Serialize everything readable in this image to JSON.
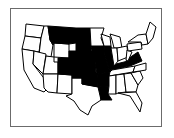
{
  "map": {
    "title": "",
    "region": "Contiguous United States",
    "colors": {
      "highlighted": "#000000",
      "default": "#ffffff",
      "border": "#000000",
      "frame": "#6b6b6b"
    },
    "highlighted_states": [
      "Montana",
      "North Dakota",
      "South Dakota",
      "Nebraska",
      "Colorado",
      "Kansas",
      "Oklahoma",
      "Iowa",
      "Missouri",
      "Arkansas",
      "Louisiana",
      "Illinois",
      "Kentucky",
      "Virginia"
    ]
  }
}
